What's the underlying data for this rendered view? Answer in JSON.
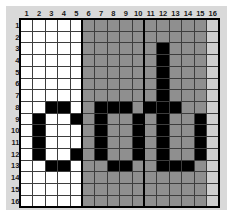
{
  "widget": {
    "name": "pixel-grid-editor",
    "word_rendered": "cob",
    "rows": 16,
    "cols": 16
  },
  "colors": {
    "panel_background": "#d9d9d9",
    "zone_white": "#ffffff",
    "zone_gray": "#8f8f8f",
    "zone_light": "#cfcfcf",
    "pixel_on": "#000000",
    "gridline": "#3d3d3d",
    "heavy_line": "#000000",
    "header_text": "#1a1a1a"
  },
  "headers": {
    "columns": [
      "1",
      "2",
      "3",
      "4",
      "5",
      "6",
      "7",
      "8",
      "9",
      "10",
      "11",
      "12",
      "13",
      "14",
      "15",
      "16"
    ],
    "rows": [
      "1",
      "2",
      "3",
      "4",
      "5",
      "6",
      "7",
      "8",
      "9",
      "10",
      "11",
      "12",
      "13",
      "14",
      "15",
      "16"
    ]
  },
  "zones": [
    {
      "name": "letter-c-zone",
      "shade": "white",
      "col_start": 1,
      "col_end": 5
    },
    {
      "name": "letter-o-zone",
      "shade": "gray",
      "col_start": 6,
      "col_end": 15
    },
    {
      "name": "margin-zone",
      "shade": "light",
      "col_start": 16,
      "col_end": 16
    }
  ],
  "heavy_separator_columns": [
    6,
    11
  ],
  "grid_cells": [
    [
      "0",
      "0",
      "0",
      "0",
      "0",
      "0",
      "0",
      "0",
      "0",
      "0",
      "0",
      "0",
      "0",
      "0",
      "0",
      "0"
    ],
    [
      "0",
      "0",
      "0",
      "0",
      "0",
      "0",
      "0",
      "0",
      "0",
      "0",
      "0",
      "0",
      "0",
      "0",
      "0",
      "0"
    ],
    [
      "0",
      "0",
      "0",
      "0",
      "0",
      "0",
      "0",
      "0",
      "0",
      "0",
      "0",
      "1",
      "0",
      "0",
      "0",
      "0"
    ],
    [
      "0",
      "0",
      "0",
      "0",
      "0",
      "0",
      "0",
      "0",
      "0",
      "0",
      "0",
      "1",
      "0",
      "0",
      "0",
      "0"
    ],
    [
      "0",
      "0",
      "0",
      "0",
      "0",
      "0",
      "0",
      "0",
      "0",
      "0",
      "0",
      "1",
      "0",
      "0",
      "0",
      "0"
    ],
    [
      "0",
      "0",
      "0",
      "0",
      "0",
      "0",
      "0",
      "0",
      "0",
      "0",
      "0",
      "1",
      "0",
      "0",
      "0",
      "0"
    ],
    [
      "0",
      "0",
      "0",
      "0",
      "0",
      "0",
      "0",
      "0",
      "0",
      "0",
      "0",
      "1",
      "0",
      "0",
      "0",
      "0"
    ],
    [
      "0",
      "0",
      "1",
      "1",
      "0",
      "0",
      "1",
      "1",
      "1",
      "0",
      "1",
      "1",
      "1",
      "0",
      "0",
      "0"
    ],
    [
      "0",
      "1",
      "0",
      "0",
      "1",
      "0",
      "1",
      "0",
      "0",
      "1",
      "0",
      "1",
      "0",
      "0",
      "1",
      "0"
    ],
    [
      "0",
      "1",
      "0",
      "0",
      "0",
      "0",
      "1",
      "0",
      "0",
      "1",
      "0",
      "1",
      "0",
      "0",
      "1",
      "0"
    ],
    [
      "0",
      "1",
      "0",
      "0",
      "0",
      "0",
      "1",
      "0",
      "0",
      "1",
      "0",
      "1",
      "0",
      "0",
      "1",
      "0"
    ],
    [
      "0",
      "1",
      "0",
      "0",
      "1",
      "0",
      "1",
      "0",
      "0",
      "1",
      "0",
      "1",
      "0",
      "0",
      "1",
      "0"
    ],
    [
      "0",
      "0",
      "1",
      "1",
      "0",
      "0",
      "0",
      "1",
      "1",
      "0",
      "0",
      "1",
      "1",
      "1",
      "0",
      "0"
    ],
    [
      "0",
      "0",
      "0",
      "0",
      "0",
      "0",
      "0",
      "0",
      "0",
      "0",
      "0",
      "0",
      "0",
      "0",
      "0",
      "0"
    ],
    [
      "0",
      "0",
      "0",
      "0",
      "0",
      "0",
      "0",
      "0",
      "0",
      "0",
      "0",
      "0",
      "0",
      "0",
      "0",
      "0"
    ],
    [
      "0",
      "0",
      "0",
      "0",
      "0",
      "0",
      "0",
      "0",
      "0",
      "0",
      "0",
      "0",
      "0",
      "0",
      "0",
      "0"
    ]
  ]
}
